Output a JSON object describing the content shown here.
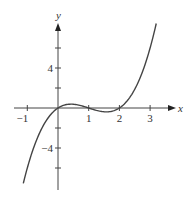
{
  "chart_data": {
    "type": "line",
    "title": "",
    "xlabel": "x",
    "ylabel": "y",
    "function": "y = x(x-1)(x-2)",
    "x_ticks": [
      -1,
      1,
      2,
      3
    ],
    "x_tick_labels": [
      "−1",
      "1",
      "2",
      "3"
    ],
    "y_ticks": [
      -6,
      -4,
      -2,
      2,
      4,
      6
    ],
    "y_tick_labels_shown": {
      "4": "4",
      "-4": "−4"
    },
    "xlim": [
      -1.3,
      3.75
    ],
    "ylim": [
      -8.2,
      8.8
    ],
    "x_domain": [
      -1.13,
      3.2
    ],
    "series": [
      {
        "name": "curve",
        "x": [
          -1.1,
          -1.0,
          -0.75,
          -0.5,
          -0.25,
          0,
          0.25,
          0.42,
          0.5,
          0.75,
          1.0,
          1.25,
          1.5,
          1.58,
          1.75,
          2.0,
          2.25,
          2.5,
          2.75,
          3.0,
          3.2
        ],
        "y": [
          -7.04,
          -6.0,
          -3.61,
          -1.88,
          -0.7,
          0,
          0.33,
          0.38,
          0.38,
          0.23,
          0,
          -0.23,
          -0.38,
          -0.38,
          -0.33,
          0,
          0.7,
          1.88,
          3.61,
          6.0,
          8.45
        ]
      }
    ],
    "grid": false,
    "legend": null
  },
  "axes": {
    "x_label": "x",
    "y_label": "y"
  },
  "colors": {
    "curve": "#444444",
    "axis": "#444444",
    "text": "#333333"
  }
}
